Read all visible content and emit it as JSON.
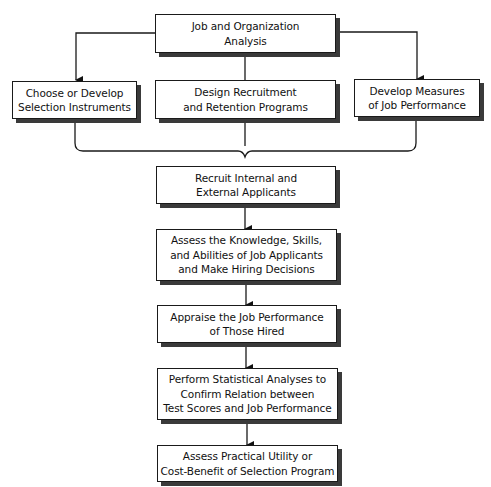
{
  "diagram": {
    "type": "flowchart",
    "colors": {
      "stroke": "#1a1a1a",
      "shadow": "#3a3a3a",
      "background": "#ffffff"
    },
    "nodes": [
      {
        "id": "job-analysis",
        "label": "Job and Organization\nAnalysis"
      },
      {
        "id": "choose-instruments",
        "label": "Choose or Develop\nSelection Instruments"
      },
      {
        "id": "design-programs",
        "label": "Design Recruitment\nand Retention Programs"
      },
      {
        "id": "develop-measures",
        "label": "Develop Measures\nof Job Performance"
      },
      {
        "id": "recruit-applicants",
        "label": "Recruit Internal and\nExternal Applicants"
      },
      {
        "id": "assess-ksa",
        "label": "Assess the Knowledge, Skills,\nand Abilities of Job Applicants\nand Make Hiring Decisions"
      },
      {
        "id": "appraise-performance",
        "label": "Appraise the Job Performance\nof Those Hired"
      },
      {
        "id": "statistical-analyses",
        "label": "Perform Statistical Analyses to\nConfirm Relation between\nTest Scores and Job Performance"
      },
      {
        "id": "assess-utility",
        "label": "Assess Practical Utility or\nCost-Benefit of Selection Program"
      }
    ],
    "edges": [
      {
        "from": "job-analysis",
        "to": "choose-instruments",
        "arrow": true
      },
      {
        "from": "job-analysis",
        "to": "design-programs",
        "arrow": false
      },
      {
        "from": "job-analysis",
        "to": "develop-measures",
        "arrow": true
      },
      {
        "from": [
          "choose-instruments",
          "design-programs",
          "develop-measures"
        ],
        "to": "recruit-applicants",
        "style": "brace"
      },
      {
        "from": "recruit-applicants",
        "to": "assess-ksa",
        "arrow": true
      },
      {
        "from": "assess-ksa",
        "to": "appraise-performance",
        "arrow": true
      },
      {
        "from": "appraise-performance",
        "to": "statistical-analyses",
        "arrow": true
      },
      {
        "from": "statistical-analyses",
        "to": "assess-utility",
        "arrow": true
      }
    ]
  }
}
